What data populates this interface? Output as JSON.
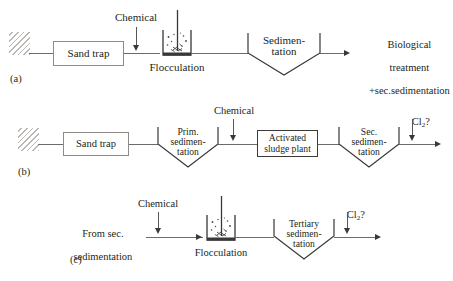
{
  "figure": {
    "type": "process-flow-diagram",
    "background_color": "#ffffff",
    "line_color": "#6d6a68",
    "text_color": "#231f20"
  },
  "rows": {
    "a": {
      "tag": "(a)",
      "inlet_symbol": "hatched-wall",
      "sand_trap": "Sand trap",
      "chemical_dose": "Chemical",
      "flocculation": "Flocculation",
      "sedimentation_line1": "Sedimen-",
      "sedimentation_line2": "tation",
      "outlet_line1": "Biological",
      "outlet_line2": "treatment",
      "outlet_line3": "+sec.sedimentation"
    },
    "b": {
      "tag": "(b)",
      "inlet_symbol": "hatched-wall",
      "sand_trap": "Sand trap",
      "prim_sed_line1": "Prim.",
      "prim_sed_line2": "sedimen-",
      "prim_sed_line3": "tation",
      "chemical_dose": "Chemical",
      "activated_sludge_line1": "Activated",
      "activated_sludge_line2": "sludge plant",
      "sec_sed_line1": "Sec.",
      "sec_sed_line2": "sedimen-",
      "sec_sed_line3": "tation",
      "chlorine_dose": "Cl",
      "chlorine_sub": "2",
      "chlorine_suffix": "?"
    },
    "c": {
      "tag": "(c)",
      "source_line1": "From sec.",
      "source_line2": "sedimentation",
      "chemical_dose": "Chemical",
      "flocculation": "Flocculation",
      "tertiary_line1": "Tertiary",
      "tertiary_line2": "sedimen-",
      "tertiary_line3": "tation",
      "chlorine_dose": "Cl",
      "chlorine_sub": "2",
      "chlorine_suffix": "?"
    }
  }
}
